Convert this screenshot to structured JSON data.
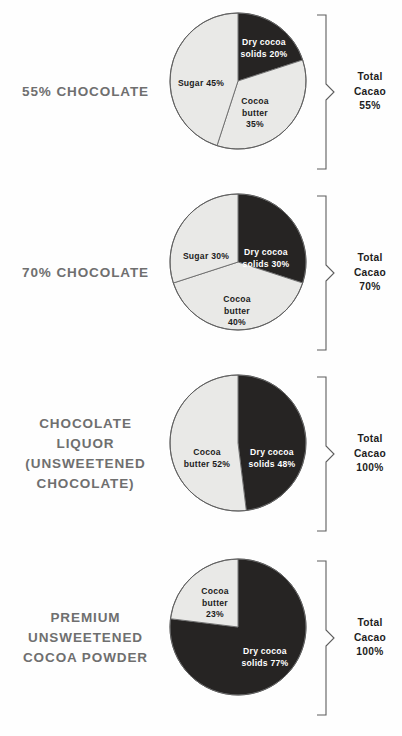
{
  "chart_data": [
    {
      "type": "pie",
      "title": "55% CHOCOLATE",
      "title_lines": [
        "55% CHOCOLATE"
      ],
      "categories": [
        "Dry cocoa solids",
        "Cocoa butter",
        "Sugar"
      ],
      "values": [
        20,
        35,
        45
      ],
      "slice_labels": [
        "Dry cocoa\nsolids 20%",
        "Cocoa\nbutter\n35%",
        "Sugar 45%"
      ],
      "slice_colors": [
        "#262423",
        "#e9e9e7",
        "#e9e9e7"
      ],
      "total_lines": [
        "Total",
        "Cacao",
        "55%"
      ],
      "total_value": "55%"
    },
    {
      "type": "pie",
      "title": "70% CHOCOLATE",
      "title_lines": [
        "70% CHOCOLATE"
      ],
      "categories": [
        "Dry cocoa solids",
        "Cocoa butter",
        "Sugar"
      ],
      "values": [
        30,
        40,
        30
      ],
      "slice_labels": [
        "Dry cocoa\nsolids 30%",
        "Cocoa\nbutter\n40%",
        "Sugar 30%"
      ],
      "slice_colors": [
        "#262423",
        "#e9e9e7",
        "#e9e9e7"
      ],
      "total_lines": [
        "Total",
        "Cacao",
        "70%"
      ],
      "total_value": "70%"
    },
    {
      "type": "pie",
      "title": "CHOCOLATE LIQUOR (UNSWEETENED CHOCOLATE)",
      "title_lines": [
        "CHOCOLATE",
        "LIQUOR",
        "(UNSWEETENED",
        "CHOCOLATE)"
      ],
      "categories": [
        "Dry cocoa solids",
        "Cocoa butter"
      ],
      "values": [
        48,
        52
      ],
      "slice_labels": [
        "Dry cocoa\nsolids 48%",
        "Cocoa\nbutter 52%"
      ],
      "slice_colors": [
        "#262423",
        "#e9e9e7"
      ],
      "total_lines": [
        "Total",
        "Cacao",
        "100%"
      ],
      "total_value": "100%"
    },
    {
      "type": "pie",
      "title": "PREMIUM UNSWEETENED COCOA POWDER",
      "title_lines": [
        "PREMIUM",
        "UNSWEETENED",
        "COCOA POWDER"
      ],
      "categories": [
        "Dry cocoa solids",
        "Cocoa butter"
      ],
      "values": [
        77,
        23
      ],
      "slice_labels": [
        "Dry cocoa\nsolids 77%",
        "Cocoa\nbutter\n23%"
      ],
      "slice_colors": [
        "#262423",
        "#e9e9e7"
      ],
      "total_lines": [
        "Total",
        "Cacao",
        "100%"
      ],
      "total_value": "100%"
    }
  ],
  "rows": [
    {
      "label_lines": [
        "55% CHOCOLATE"
      ],
      "total_lines": [
        "Total",
        "Cacao",
        "55%"
      ],
      "slices": [
        {
          "name": "dry-cocoa-solids",
          "value": 20,
          "start": 0,
          "end": 72,
          "tone": "dark",
          "label": "Dry cocoa\nsolids 20%",
          "lx": 64,
          "ly": 25,
          "lw": 62
        },
        {
          "name": "cocoa-butter",
          "value": 35,
          "start": 72,
          "end": 198,
          "tone": "light",
          "label": "Cocoa\nbutter\n35%",
          "lx": 62,
          "ly": 84,
          "lw": 48
        },
        {
          "name": "sugar",
          "value": 45,
          "start": 198,
          "end": 360,
          "tone": "light",
          "label": "Sugar 45%",
          "lx": 3,
          "ly": 66,
          "lw": 58
        }
      ]
    },
    {
      "label_lines": [
        "70% CHOCOLATE"
      ],
      "total_lines": [
        "Total",
        "Cacao",
        "70%"
      ],
      "slices": [
        {
          "name": "dry-cocoa-solids",
          "value": 30,
          "start": 0,
          "end": 108,
          "tone": "dark",
          "label": "Dry cocoa\nsolids 30%",
          "lx": 66,
          "ly": 54,
          "lw": 62
        },
        {
          "name": "cocoa-butter",
          "value": 40,
          "start": 108,
          "end": 252,
          "tone": "light",
          "label": "Cocoa\nbutter\n40%",
          "lx": 44,
          "ly": 101,
          "lw": 48
        },
        {
          "name": "sugar",
          "value": 30,
          "start": 252,
          "end": 360,
          "tone": "light",
          "label": "Sugar 30%",
          "lx": 8,
          "ly": 58,
          "lw": 58
        }
      ]
    },
    {
      "label_lines": [
        "CHOCOLATE",
        "LIQUOR",
        "(UNSWEETENED",
        "CHOCOLATE)"
      ],
      "total_lines": [
        "Total",
        "Cacao",
        "100%"
      ],
      "slices": [
        {
          "name": "dry-cocoa-solids",
          "value": 48,
          "start": 0,
          "end": 173,
          "tone": "dark",
          "label": "Dry cocoa\nsolids 48%",
          "lx": 72,
          "ly": 73,
          "lw": 62
        },
        {
          "name": "cocoa-butter",
          "value": 52,
          "start": 173,
          "end": 360,
          "tone": "light",
          "label": "Cocoa\nbutter 52%",
          "lx": 8,
          "ly": 73,
          "lw": 60
        }
      ]
    },
    {
      "label_lines": [
        "PREMIUM",
        "UNSWEETENED",
        "COCOA POWDER"
      ],
      "total_lines": [
        "Total",
        "Cacao",
        "100%"
      ],
      "slices": [
        {
          "name": "dry-cocoa-solids",
          "value": 77,
          "start": 0,
          "end": 277,
          "tone": "dark",
          "label": "Dry cocoa\nsolids 77%",
          "lx": 64,
          "ly": 88,
          "lw": 64
        },
        {
          "name": "cocoa-butter",
          "value": 23,
          "start": 277,
          "end": 360,
          "tone": "light",
          "label": "Cocoa\nbutter\n23%",
          "lx": 22,
          "ly": 28,
          "lw": 48
        }
      ]
    }
  ]
}
